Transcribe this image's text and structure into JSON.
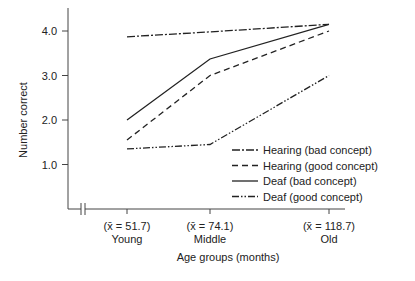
{
  "chart_data": {
    "type": "line",
    "title": "",
    "xlabel": "Age groups (months)",
    "ylabel": "Number correct",
    "ylim": [
      0,
      4.5
    ],
    "yticks": [
      "1.0",
      "2.0",
      "3.0",
      "4.0"
    ],
    "categories": [
      "Young",
      "Middle",
      "Old"
    ],
    "category_means": [
      "(x̄ = 51.7)",
      "(x̄ = 74.1)",
      "(x̄ = 118.7)"
    ],
    "x_means": [
      51.7,
      74.1,
      118.7
    ],
    "grid": false,
    "legend_position": "lower right",
    "series": [
      {
        "name": "Hearing (bad concept)",
        "style": "dash-dot",
        "values": [
          3.87,
          3.98,
          4.15
        ]
      },
      {
        "name": "Hearing (good concept)",
        "style": "dashed",
        "values": [
          1.55,
          3.0,
          4.0
        ]
      },
      {
        "name": "Deaf (bad concept)",
        "style": "solid",
        "values": [
          2.0,
          3.37,
          4.15
        ]
      },
      {
        "name": "Deaf (good concept)",
        "style": "dash-dot-dot",
        "values": [
          1.35,
          1.45,
          3.0
        ]
      }
    ]
  }
}
